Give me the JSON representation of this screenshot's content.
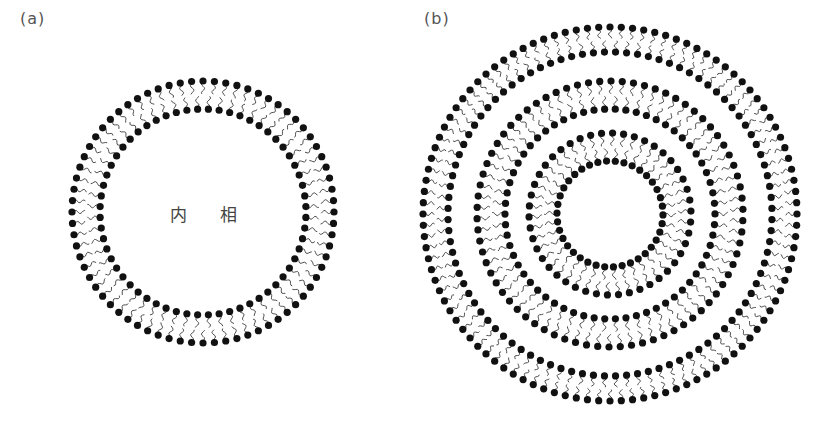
{
  "figure": {
    "panels": [
      {
        "id": "a",
        "label": "(a)",
        "description": "unilamellar vesicle (single lipid bilayer)",
        "center_label": "内 相",
        "center": [
          203,
          212
        ],
        "bilayers": [
          {
            "outer_radius": 131,
            "inner_radius": 103,
            "outer_count": 72,
            "inner_count": 60
          }
        ]
      },
      {
        "id": "b",
        "label": "(b)",
        "description": "multilamellar vesicle (three concentric lipid bilayers)",
        "center_label": "",
        "center": [
          610,
          214
        ],
        "bilayers": [
          {
            "outer_radius": 187,
            "inner_radius": 162,
            "outer_count": 104,
            "inner_count": 92
          },
          {
            "outer_radius": 133,
            "inner_radius": 105,
            "outer_count": 74,
            "inner_count": 62
          },
          {
            "outer_radius": 81,
            "inner_radius": 53,
            "outer_count": 46,
            "inner_count": 38
          }
        ]
      }
    ],
    "style": {
      "head_color": "#111111",
      "tail_color": "#3a3a3a",
      "head_radius": 3.6,
      "tail_width": 0.9
    }
  }
}
